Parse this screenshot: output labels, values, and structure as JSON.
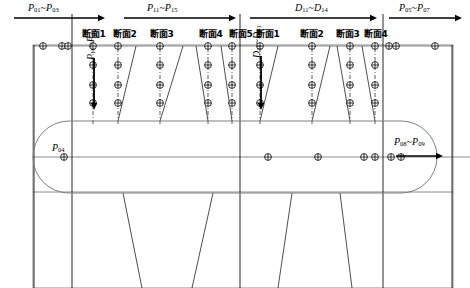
{
  "figure": {
    "type": "engineering-survey-diagram",
    "colors": {
      "line": "#000000",
      "outline": "#808080",
      "dashed": "#333333",
      "background": "#ffffff"
    }
  },
  "top_arrows": [
    {
      "id": "a1",
      "label_base": "P",
      "label": "P01~P03",
      "p1": "01",
      "p2": "03",
      "sep": "~",
      "x": 14,
      "y": 18,
      "x2": 105,
      "dir": "right"
    },
    {
      "id": "a2",
      "label_base": "P",
      "label": "P11~P15",
      "p1": "11",
      "p2": "15",
      "sep": "~",
      "x": 124,
      "y": 18,
      "x2": 236,
      "dir": "right"
    },
    {
      "id": "a3",
      "label_base": "D",
      "label": "D11~D14",
      "p1": "11",
      "p2": "14",
      "sep": "~",
      "x": 250,
      "y": 18,
      "x2": 377,
      "dir": "right"
    },
    {
      "id": "a4",
      "label_base": "P",
      "label": "P05~P07",
      "p1": "05",
      "p2": "07",
      "sep": "~",
      "x": 389,
      "y": 18,
      "x2": 462,
      "dir": "right"
    }
  ],
  "top_arrow_labels": [
    {
      "base": "P",
      "sub1": "01",
      "sub2": "03",
      "left": 28,
      "top": 3
    },
    {
      "base": "P",
      "sub1": "11",
      "sub2": "15",
      "left": 147,
      "top": 3
    },
    {
      "base": "D",
      "sub1": "11",
      "sub2": "14",
      "left": 295,
      "top": 3
    },
    {
      "base": "P",
      "sub1": "05",
      "sub2": "07",
      "left": 399,
      "top": 3
    }
  ],
  "vertical_arrow_labels": [
    {
      "base": "P",
      "sub1": "11",
      "sub2": "41",
      "left": 86,
      "top": 60,
      "arrow_x": 94,
      "arrow_y1": 58,
      "arrow_y2": 110
    },
    {
      "base": "D",
      "sub1": "11",
      "sub2": "31",
      "left": 252,
      "top": 58,
      "arrow_x": 261,
      "arrow_y1": 56,
      "arrow_y2": 110
    }
  ],
  "point_labels": [
    {
      "base": "P",
      "sub1": "04",
      "sub2": null,
      "left": 52,
      "top": 143
    },
    {
      "base": "P",
      "sub1": "08",
      "sub2": "09",
      "left": 394,
      "top": 137
    }
  ],
  "inner_arrow": {
    "x1": 396,
    "x2": 443,
    "y": 156
  },
  "section_labels": [
    {
      "text": "断面1",
      "x": 82,
      "y": 30
    },
    {
      "text": "断面2",
      "x": 113,
      "y": 30
    },
    {
      "text": "断面3",
      "x": 150,
      "y": 30
    },
    {
      "text": "断面4",
      "x": 199,
      "y": 30
    },
    {
      "text": "断面5",
      "x": 229,
      "y": 30
    },
    {
      "text": "断面1",
      "x": 256,
      "y": 30
    },
    {
      "text": "断面2",
      "x": 300,
      "y": 30
    },
    {
      "text": "断面3",
      "x": 336,
      "y": 30
    },
    {
      "text": "断面4",
      "x": 364,
      "y": 30
    }
  ],
  "frame": {
    "x": 33,
    "y": 45,
    "w": 420,
    "h": 243
  },
  "horizontal_lines": [
    {
      "id": "top-axis",
      "x1": 33,
      "x2": 453,
      "y": 46
    },
    {
      "id": "upper-band",
      "x1": 33,
      "x2": 453,
      "y": 192
    },
    {
      "id": "center-axis",
      "x1": 33,
      "x2": 470,
      "y": 157
    }
  ],
  "vertical_frame_lines": [
    {
      "id": "v-left-edge",
      "x": 34,
      "y1": 45,
      "y2": 288
    },
    {
      "id": "v-sec-a",
      "x": 72,
      "y1": 14,
      "y2": 288
    },
    {
      "id": "v-mid",
      "x": 240,
      "y1": 14,
      "y2": 288
    },
    {
      "id": "v-sec-b",
      "x": 383,
      "y1": 14,
      "y2": 288
    },
    {
      "id": "v-right-edge",
      "x": 452,
      "y1": 45,
      "y2": 288
    }
  ],
  "dashed_columns_left": [
    {
      "x": 93
    },
    {
      "x": 118
    },
    {
      "x": 160
    },
    {
      "x": 208
    },
    {
      "x": 232
    }
  ],
  "dashed_columns_right": [
    {
      "x": 260
    },
    {
      "x": 312
    },
    {
      "x": 350
    },
    {
      "x": 375
    }
  ],
  "grid_rows": [
    65,
    85,
    103
  ],
  "top_axis_markers": [
    {
      "x": 43
    },
    {
      "x": 62
    },
    {
      "x": 68
    },
    {
      "x": 93
    },
    {
      "x": 118
    },
    {
      "x": 160
    },
    {
      "x": 208
    },
    {
      "x": 232
    },
    {
      "x": 260
    },
    {
      "x": 312
    },
    {
      "x": 350
    },
    {
      "x": 375
    },
    {
      "x": 389
    },
    {
      "x": 396
    },
    {
      "x": 435
    }
  ],
  "center_axis_markers": [
    {
      "x": 64
    },
    {
      "x": 268
    },
    {
      "x": 318
    },
    {
      "x": 364
    },
    {
      "x": 375
    },
    {
      "x": 391
    },
    {
      "x": 401
    }
  ],
  "oval": {
    "x": 33,
    "y": 121,
    "w": 404,
    "h": 72,
    "rx": 36
  },
  "splay_lines_upper": [
    {
      "x1": 118,
      "y1": 121,
      "x2": 136,
      "y2": 46
    },
    {
      "x1": 160,
      "y1": 121,
      "x2": 183,
      "y2": 46
    },
    {
      "x1": 208,
      "y1": 121,
      "x2": 196,
      "y2": 46
    },
    {
      "x1": 232,
      "y1": 121,
      "x2": 221,
      "y2": 46
    },
    {
      "x1": 260,
      "y1": 121,
      "x2": 278,
      "y2": 46
    },
    {
      "x1": 312,
      "y1": 121,
      "x2": 330,
      "y2": 46
    },
    {
      "x1": 350,
      "y1": 121,
      "x2": 337,
      "y2": 46
    },
    {
      "x1": 375,
      "y1": 121,
      "x2": 362,
      "y2": 46
    }
  ],
  "splay_lines_lower": [
    {
      "x1": 123,
      "y1": 193,
      "x2": 142,
      "y2": 288
    },
    {
      "x1": 213,
      "y1": 193,
      "x2": 192,
      "y2": 288
    },
    {
      "x1": 292,
      "y1": 193,
      "x2": 278,
      "y2": 288
    },
    {
      "x1": 340,
      "y1": 193,
      "x2": 352,
      "y2": 288
    }
  ]
}
